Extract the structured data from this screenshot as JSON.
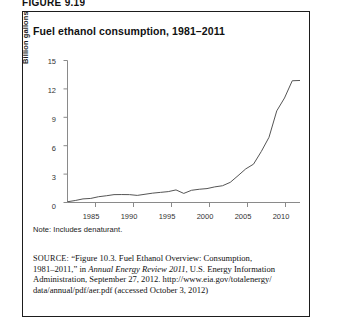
{
  "figure": {
    "header": "FIGURE 9.19"
  },
  "chart": {
    "title": "Fuel ethanol consumption, 1981–2011",
    "note": "Note: Includes denaturant.",
    "axis": {
      "ylabel": "Billion gallons",
      "yticks": [
        "0",
        "3",
        "6",
        "9",
        "12",
        "15"
      ],
      "xticks": [
        "1985",
        "1990",
        "1995",
        "2000",
        "2005",
        "2010"
      ]
    },
    "line_color": "#555555",
    "axis_color": "#8a8a8a",
    "border_color": "#1d1d1d"
  },
  "source": {
    "label": "SOURCE:",
    "line1_rest": " “Figure 10.3. Fuel Ethanol Overview: Consumption,",
    "line2_a": "1981–2011,” in ",
    "line2_italic": "Annual Energy Review 2011",
    "line2_b": ", U.S. Energy Information",
    "line3": "Administration, September 27, 2012. http://www.eia.gov/totalenergy/",
    "line4": "data/annual/pdf/aer.pdf (accessed October 3, 2012)"
  },
  "chart_data": {
    "type": "line",
    "title": "Fuel ethanol consumption, 1981–2011",
    "xlabel": "",
    "ylabel": "Billion gallons",
    "xlim": [
      1981,
      2011
    ],
    "ylim": [
      0,
      15
    ],
    "grid": false,
    "legend": "none",
    "x": [
      1981,
      1982,
      1983,
      1984,
      1985,
      1986,
      1987,
      1988,
      1989,
      1990,
      1991,
      1992,
      1993,
      1994,
      1995,
      1996,
      1997,
      1998,
      1999,
      2000,
      2001,
      2002,
      2003,
      2004,
      2005,
      2006,
      2007,
      2008,
      2009,
      2010,
      2011
    ],
    "values": [
      0.08,
      0.21,
      0.38,
      0.43,
      0.61,
      0.71,
      0.83,
      0.84,
      0.83,
      0.75,
      0.87,
      0.99,
      1.07,
      1.15,
      1.33,
      0.96,
      1.29,
      1.4,
      1.47,
      1.65,
      1.77,
      2.13,
      2.83,
      3.55,
      4.05,
      5.38,
      6.89,
      9.68,
      11.04,
      12.86,
      12.89
    ],
    "ytick_values": [
      0,
      3,
      6,
      9,
      12,
      15
    ],
    "xtick_values": [
      1985,
      1990,
      1995,
      2000,
      2005,
      2010
    ],
    "units": "billion gallons"
  }
}
